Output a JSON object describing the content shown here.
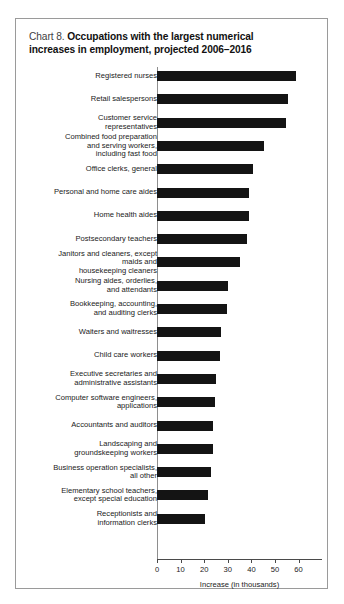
{
  "chart_box": {
    "title_prefix": "Chart 8.",
    "title_line1": "Occupations with the largest numerical",
    "title_line2": "increases in employment, projected 2006–2016"
  },
  "chart_data": {
    "type": "bar",
    "orientation": "horizontal",
    "title": "Chart 8. Occupations with the largest numerical increases in employment, projected 2006–2016",
    "xlabel": "Increase (in thousands)",
    "ylabel": "",
    "xlim": [
      0,
      60
    ],
    "xticks": [
      0,
      10,
      20,
      30,
      40,
      50,
      60
    ],
    "xtick_labels": [
      "0",
      "10",
      "20",
      "30",
      "40",
      "50",
      "60"
    ],
    "grid": false,
    "legend": null,
    "bar_color": "#141414",
    "categories": [
      "Registered nurses",
      "Retail salespersons",
      "Customer service\nrepresentatives",
      "Combined food preparation\nand serving workers,\nincluding fast food",
      "Office clerks, general",
      "Personal and home care aides",
      "Home health aides",
      "Postsecondary teachers",
      "Janitors and cleaners, except\nmaids and\nhousekeeping cleaners",
      "Nursing aides, orderlies,\nand attendants",
      "Bookkeeping, accounting,\nand auditing clerks",
      "Waiters and waitresses",
      "Child care workers",
      "Executive secretaries and\nadministrative assistants",
      "Computer software engineers,\napplications",
      "Accountants and auditors",
      "Landscaping and\ngroundskeeping workers",
      "Business operation specialists,\nall other",
      "Elementary school teachers,\nexcept special education",
      "Receptionists and\ninformation clerks"
    ],
    "values": [
      58.7,
      55.4,
      54.5,
      45.4,
      40.8,
      38.9,
      38.9,
      38.2,
      35.3,
      30.1,
      29.8,
      27.0,
      26.5,
      25.0,
      24.5,
      23.6,
      23.6,
      22.9,
      21.5,
      20.5
    ]
  }
}
